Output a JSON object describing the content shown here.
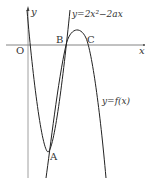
{
  "diagram": {
    "axes": {
      "x_label": "x",
      "y_label": "y",
      "origin_label": "O"
    },
    "curves": [
      {
        "name": "parabola",
        "label": "y=2x²−2ax"
      },
      {
        "name": "cubic",
        "label": "y=f(x)"
      }
    ],
    "points": [
      {
        "label": "A"
      },
      {
        "label": "B"
      },
      {
        "label": "C"
      }
    ],
    "colors": {
      "stroke": "#222222",
      "axis": "#555555",
      "text": "#333333"
    }
  }
}
